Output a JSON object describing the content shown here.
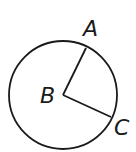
{
  "diagram": {
    "type": "circle-with-radii",
    "circle": {
      "cx": 63,
      "cy": 95,
      "r": 54
    },
    "center": {
      "label": "B",
      "x": 63,
      "y": 95
    },
    "points": [
      {
        "label": "A",
        "x": 86,
        "y": 48
      },
      {
        "label": "C",
        "x": 111,
        "y": 117
      }
    ],
    "segments": [
      [
        "B",
        "A"
      ],
      [
        "B",
        "C"
      ]
    ],
    "stroke_color": "#1a1a1a"
  }
}
